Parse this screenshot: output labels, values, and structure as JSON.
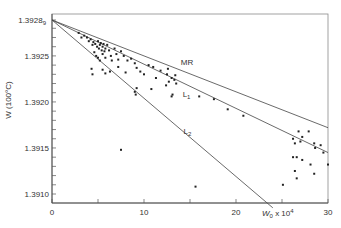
{
  "chart_data": {
    "type": "scatter",
    "title": "",
    "xlabel": "W0 x 10^4",
    "xlabel_parts": {
      "base": "W",
      "sub": "0",
      "mid": " x 10",
      "sup": "4"
    },
    "ylabel": "W (100°C)",
    "xlim": [
      0,
      30
    ],
    "ylim": [
      1.39085,
      1.39289
    ],
    "x_ticks": [
      0,
      5,
      10,
      15,
      20,
      25,
      30
    ],
    "x_tick_labels": [
      {
        "value": 0,
        "label": "0"
      },
      {
        "value": 10,
        "label": "10"
      },
      {
        "value": 20,
        "label": "20"
      },
      {
        "value": 30,
        "label": "30"
      }
    ],
    "y_ticks": [
      1.391,
      1.3911,
      1.3912,
      1.3913,
      1.3914,
      1.3915,
      1.3916,
      1.3917,
      1.3918,
      1.3919,
      1.392,
      1.3921,
      1.3922,
      1.3923,
      1.3924,
      1.3925,
      1.3926,
      1.3927,
      1.3928
    ],
    "y_tick_labels": [
      {
        "value": 1.39289,
        "label": "1.3928",
        "sub": "9"
      },
      {
        "value": 1.3925,
        "label": "1.3925"
      },
      {
        "value": 1.392,
        "label": "1.3920"
      },
      {
        "value": 1.3915,
        "label": "1.3915"
      },
      {
        "value": 1.391,
        "label": "1.3910"
      }
    ],
    "grid": false,
    "lines": [
      {
        "name": "MR",
        "label": "MR",
        "x": [
          0,
          30
        ],
        "y": [
          1.39289,
          1.39172
        ],
        "label_at": [
          14,
          1.3924
        ]
      },
      {
        "name": "L1",
        "label": "L",
        "label_sub": "1",
        "x": [
          0,
          30
        ],
        "y": [
          1.39289,
          1.39145
        ],
        "label_at": [
          14.2,
          1.39205
        ]
      },
      {
        "name": "L2",
        "label": "L",
        "label_sub": "2",
        "x": [
          0,
          24
        ],
        "y": [
          1.39289,
          1.39085
        ],
        "label_at": [
          14.3,
          1.39165
        ]
      }
    ],
    "points": [
      [
        2.9,
        1.39275
      ],
      [
        3.5,
        1.39272
      ],
      [
        3.8,
        1.3927
      ],
      [
        4.0,
        1.39266
      ],
      [
        4.2,
        1.39268
      ],
      [
        4.4,
        1.39262
      ],
      [
        4.5,
        1.39265
      ],
      [
        4.7,
        1.39263
      ],
      [
        4.9,
        1.3926
      ],
      [
        5.0,
        1.39266
      ],
      [
        5.1,
        1.39258
      ],
      [
        5.2,
        1.39262
      ],
      [
        5.3,
        1.39264
      ],
      [
        5.4,
        1.39256
      ],
      [
        5.5,
        1.3926
      ],
      [
        5.6,
        1.39263
      ],
      [
        5.7,
        1.39255
      ],
      [
        5.8,
        1.39258
      ],
      [
        4.6,
        1.39254
      ],
      [
        4.8,
        1.3925
      ],
      [
        5.0,
        1.39248
      ],
      [
        5.2,
        1.39245
      ],
      [
        5.5,
        1.39252
      ],
      [
        5.8,
        1.39248
      ],
      [
        6.0,
        1.39262
      ],
      [
        6.2,
        1.39256
      ],
      [
        6.4,
        1.3925
      ],
      [
        6.5,
        1.39245
      ],
      [
        6.8,
        1.39258
      ],
      [
        7.0,
        1.39252
      ],
      [
        7.2,
        1.39246
      ],
      [
        7.5,
        1.39255
      ],
      [
        7.8,
        1.3925
      ],
      [
        8.2,
        1.39245
      ],
      [
        8.6,
        1.39247
      ],
      [
        9.0,
        1.39242
      ],
      [
        5.5,
        1.39235
      ],
      [
        6.3,
        1.39233
      ],
      [
        7.2,
        1.39238
      ],
      [
        8.0,
        1.39232
      ],
      [
        9.2,
        1.39237
      ],
      [
        9.6,
        1.39233
      ],
      [
        5.8,
        1.39231
      ],
      [
        4.3,
        1.39236
      ],
      [
        3.2,
        1.3927
      ],
      [
        10.5,
        1.3924
      ],
      [
        11.0,
        1.39238
      ],
      [
        11.8,
        1.39234
      ],
      [
        12.5,
        1.3923
      ],
      [
        12.6,
        1.39236
      ],
      [
        13.0,
        1.39226
      ],
      [
        12.7,
        1.39222
      ],
      [
        13.4,
        1.39229
      ],
      [
        10.0,
        1.3923
      ],
      [
        11.3,
        1.39226
      ],
      [
        13.3,
        1.39224
      ],
      [
        12.4,
        1.39218
      ],
      [
        13.5,
        1.3922
      ],
      [
        9.0,
        1.39211
      ],
      [
        9.1,
        1.39208
      ],
      [
        10.8,
        1.39214
      ],
      [
        13.0,
        1.39206
      ],
      [
        13.1,
        1.39208
      ],
      [
        16.0,
        1.39206
      ],
      [
        17.6,
        1.39203
      ],
      [
        19.1,
        1.39192
      ],
      [
        20.8,
        1.39185
      ],
      [
        26.2,
        1.3916
      ],
      [
        27.0,
        1.39157
      ],
      [
        27.2,
        1.39162
      ],
      [
        28.5,
        1.39155
      ],
      [
        28.6,
        1.3915
      ],
      [
        29.5,
        1.39145
      ],
      [
        26.4,
        1.39155
      ],
      [
        26.2,
        1.3914
      ],
      [
        26.6,
        1.3914
      ],
      [
        27.2,
        1.39137
      ],
      [
        28.1,
        1.39132
      ],
      [
        30.0,
        1.39132
      ],
      [
        26.4,
        1.39125
      ],
      [
        26.6,
        1.39117
      ],
      [
        28.5,
        1.39122
      ],
      [
        25.1,
        1.3911
      ],
      [
        15.6,
        1.39108
      ],
      [
        7.5,
        1.39148
      ],
      [
        4.4,
        1.3923
      ],
      [
        9.2,
        1.39215
      ],
      [
        27.9,
        1.39168
      ],
      [
        29.2,
        1.39153
      ],
      [
        26.8,
        1.39168
      ]
    ]
  }
}
